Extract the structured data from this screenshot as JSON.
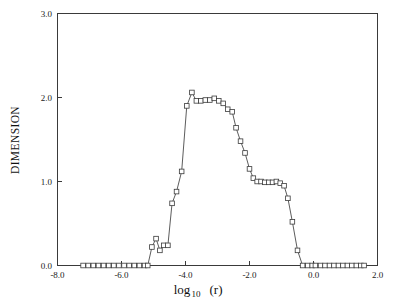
{
  "chart_data": {
    "type": "line",
    "title": "",
    "subtitle": "",
    "xlabel": "log 10 (r)",
    "xlabel_main": "log",
    "xlabel_sub": "10",
    "xlabel_tail": "(r)",
    "ylabel": "DIMENSION",
    "xlim": [
      -8.0,
      2.0
    ],
    "ylim": [
      0.0,
      3.0
    ],
    "xticks": [
      -8.0,
      -6.0,
      -4.0,
      -2.0,
      0.0,
      2.0
    ],
    "xtick_labels": [
      "-8.0",
      "-6.0",
      "-4.0",
      "-2.0",
      "0.0",
      "2.0"
    ],
    "yticks": [
      0.0,
      1.0,
      2.0,
      3.0
    ],
    "ytick_labels": [
      "0.0",
      "1.0",
      "2.0",
      "3.0"
    ],
    "grid": false,
    "legend": null,
    "marker": "square-open",
    "line_color": "#4a4a4a",
    "marker_face_color": "#ffffff",
    "marker_edge_color": "#3a3a3a",
    "series": [
      {
        "name": "dimension",
        "x": [
          -7.2,
          -7.04,
          -6.88,
          -6.72,
          -6.56,
          -6.4,
          -6.24,
          -6.08,
          -5.92,
          -5.76,
          -5.6,
          -5.44,
          -5.28,
          -5.18,
          -5.05,
          -4.92,
          -4.8,
          -4.68,
          -4.55,
          -4.42,
          -4.28,
          -4.12,
          -3.96,
          -3.8,
          -3.66,
          -3.52,
          -3.38,
          -3.24,
          -3.1,
          -2.96,
          -2.82,
          -2.68,
          -2.54,
          -2.42,
          -2.28,
          -2.14,
          -2.0,
          -1.88,
          -1.76,
          -1.64,
          -1.52,
          -1.4,
          -1.28,
          -1.16,
          -1.04,
          -0.92,
          -0.8,
          -0.66,
          -0.5,
          -0.34,
          -0.18,
          -0.04,
          0.06,
          0.22,
          0.36,
          0.5,
          0.64,
          0.78,
          0.92,
          1.06,
          1.2,
          1.34,
          1.48,
          1.58
        ],
        "y": [
          0.0,
          0.0,
          0.0,
          0.0,
          0.0,
          0.0,
          0.0,
          0.0,
          0.0,
          0.0,
          0.0,
          0.0,
          0.0,
          0.0,
          0.22,
          0.32,
          0.18,
          0.24,
          0.24,
          0.74,
          0.88,
          1.12,
          1.9,
          2.06,
          1.96,
          1.96,
          1.97,
          1.97,
          1.99,
          1.96,
          1.93,
          1.86,
          1.83,
          1.64,
          1.48,
          1.34,
          1.15,
          1.04,
          1.0,
          1.0,
          0.99,
          0.99,
          0.99,
          1.0,
          0.98,
          0.95,
          0.8,
          0.52,
          0.18,
          0.0,
          0.0,
          0.0,
          0.0,
          0.0,
          0.0,
          0.0,
          0.0,
          0.0,
          0.0,
          0.0,
          0.0,
          0.0,
          0.0,
          0.0
        ]
      }
    ],
    "annotations": []
  },
  "figure": {
    "background_color": "#ffffff",
    "axes_color": "#3a3a3a"
  }
}
